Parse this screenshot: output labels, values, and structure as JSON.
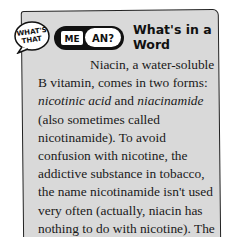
{
  "sidebar_box": {
    "logo": {
      "bubble_text_line1": "WHAT'S",
      "bubble_text_line2": "THAT",
      "pill_left": "ME",
      "pill_right": "AN?"
    },
    "title": "What's in a Word",
    "paragraph": {
      "part1": "Niacin, a water-soluble B vitamin, comes in two forms: ",
      "term1": "nicotinic acid",
      "part2": " and ",
      "term2": "niacinamide",
      "part3": " (also sometimes called nicotinamide). To avoid confusion with nicotine, the addictive substance in tobacco, the name nicotinamide isn't used very often (actually, niacin has nothing to do with nicotine). The word niacin is generally used to mean both forms. Niacinamide is the form"
    },
    "colors": {
      "background": "#d9d9d9",
      "border": "#222222",
      "text": "#1a1a1a"
    }
  }
}
